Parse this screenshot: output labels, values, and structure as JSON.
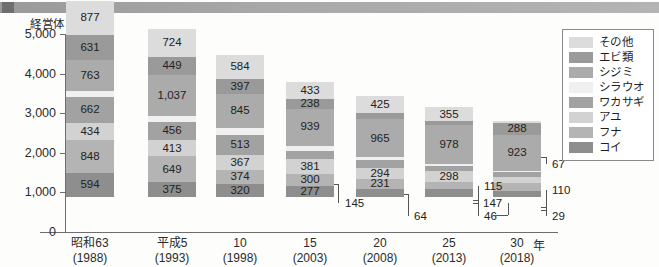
{
  "decor": {
    "header_bar": "header-bar"
  },
  "chart_data": {
    "type": "bar",
    "subtype": "stacked",
    "title": "",
    "xlabel": "",
    "ylabel": "経営体",
    "y_unit_label": "経営体",
    "x_unit_suffix": "年",
    "ylim": [
      0,
      5000
    ],
    "y_ticks": [
      "0",
      "1,000",
      "2,000",
      "3,000",
      "4,000",
      "5,000"
    ],
    "y_tick_values": [
      0,
      1000,
      2000,
      3000,
      4000,
      5000
    ],
    "grid": false,
    "legend_position": "right",
    "categories": [
      "昭和63\n(1988)",
      "平成5\n(1993)",
      "10\n(1998)",
      "15\n(2003)",
      "20\n(2008)",
      "25\n(2013)",
      "30 年\n(2018)"
    ],
    "x_labels": [
      {
        "era": "昭和63",
        "year": "(1988)"
      },
      {
        "era": "平成5",
        "year": "(1993)"
      },
      {
        "era": "10",
        "year": "(1998)"
      },
      {
        "era": "15",
        "year": "(2003)"
      },
      {
        "era": "20",
        "year": "(2008)"
      },
      {
        "era": "25",
        "year": "(2013)"
      },
      {
        "era": "30",
        "year": "(2018)"
      }
    ],
    "series": [
      {
        "name": "コイ",
        "color": "#8e8e8e",
        "values": [
          594,
          375,
          320,
          277,
          214,
          201,
          160
        ]
      },
      {
        "name": "フナ",
        "color": "#b4b4b4",
        "values": [
          848,
          649,
          374,
          300,
          231,
          170,
          206
        ]
      },
      {
        "name": "アユ",
        "color": "#d2d2d2",
        "values": [
          434,
          413,
          367,
          381,
          294,
          298,
          147
        ]
      },
      {
        "name": "ワカサギ",
        "color": "#a2a2a2",
        "values": [
          662,
          456,
          513,
          192,
          196,
          115,
          110
        ]
      },
      {
        "name": "シラウオ",
        "color": "#f0f0f0",
        "values": [
          152,
          149,
          176,
          145,
          64,
          46,
          29
        ]
      },
      {
        "name": "シジミ",
        "color": "#ababab",
        "values": [
          763,
          1037,
          845,
          939,
          965,
          978,
          923
        ]
      },
      {
        "name": "エビ類",
        "color": "#9a9a9a",
        "values": [
          631,
          449,
          397,
          238,
          163,
          103,
          288
        ]
      },
      {
        "name": "その他",
        "color": "#dcdcdc",
        "values": [
          877,
          724,
          584,
          433,
          425,
          355,
          67
        ]
      }
    ],
    "totals": [
      4961,
      4252,
      3576,
      2905,
      2552,
      2266,
      1930
    ],
    "callouts": [
      {
        "label": "145",
        "series": "シラウオ",
        "category_index": 3
      },
      {
        "label": "64",
        "series": "シラウオ",
        "category_index": 4
      },
      {
        "label": "115",
        "series": "ワカサギ",
        "category_index": 5
      },
      {
        "label": "46",
        "series": "シラウオ",
        "category_index": 5
      },
      {
        "label": "67",
        "series": "その他",
        "category_index": 6
      },
      {
        "label": "110",
        "series": "ワカサギ",
        "category_index": 6
      },
      {
        "label": "147",
        "series": "アユ",
        "category_index": 6
      },
      {
        "label": "29",
        "series": "シラウオ",
        "category_index": 6
      }
    ]
  }
}
